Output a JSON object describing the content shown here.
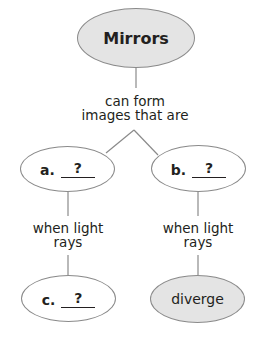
{
  "diagram": {
    "root": {
      "label": "Mirrors",
      "fill": "#e4e4e4"
    },
    "root_link": {
      "line1": "can form",
      "line2": "images that are"
    },
    "branches": [
      {
        "node": {
          "prefix": "a.",
          "blank": "?"
        },
        "link": {
          "line1": "when light",
          "line2": "rays"
        },
        "child": {
          "prefix": "c.",
          "blank": "?"
        }
      },
      {
        "node": {
          "prefix": "b.",
          "blank": "?"
        },
        "link": {
          "line1": "when light",
          "line2": "rays"
        },
        "child": {
          "label": "diverge",
          "fill": "#e4e4e4"
        }
      }
    ],
    "line_color": "#8a8a8a"
  }
}
